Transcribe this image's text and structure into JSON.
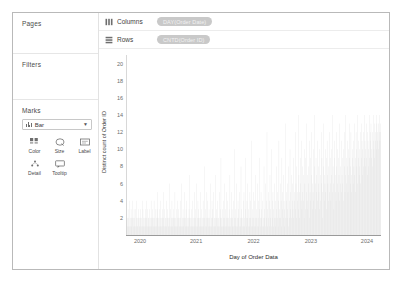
{
  "left_panel": {
    "pages_label": "Pages",
    "filters_label": "Filters",
    "marks_label": "Marks",
    "mark_type": "Bar",
    "mark_type_icon": "bar-chart-icon",
    "mark_buttons": [
      {
        "label": "Color",
        "icon": "color-icon"
      },
      {
        "label": "Size",
        "icon": "size-icon"
      },
      {
        "label": "Label",
        "icon": "label-icon"
      },
      {
        "label": "Detail",
        "icon": "detail-icon"
      },
      {
        "label": "Tooltip",
        "icon": "tooltip-icon"
      }
    ]
  },
  "shelves": {
    "columns_label": "Columns",
    "columns_icon": "columns-grid-icon",
    "columns_pill": "DAY(Order Date)",
    "rows_label": "Rows",
    "rows_icon": "rows-grid-icon",
    "rows_pill": "CNTD(Order ID)"
  },
  "colors": {
    "pill_fill": "#c9c9c9",
    "bar_fill": "#d6d6d6",
    "axis": "#9a9a9a",
    "panel_border": "#b9b9b9"
  },
  "chart_data": {
    "type": "bar",
    "title": "",
    "xlabel": "Day of Order Data",
    "ylabel": "Distinct count of Order ID",
    "xtick_labels": [
      "2020",
      "2021",
      "2022",
      "2023",
      "2024"
    ],
    "xtick_positions": [
      0.055,
      0.275,
      0.5,
      0.725,
      0.945
    ],
    "ytick_labels": [
      "20",
      "18",
      "16",
      "14",
      "12",
      "10",
      "8",
      "6",
      "4",
      "2"
    ],
    "ylim": [
      0,
      21
    ],
    "grid": false,
    "legend": null,
    "x_range": [
      "2020",
      "2024"
    ],
    "series": [
      {
        "name": "CNTD(Order ID)",
        "note": "daily distinct order counts; density and height increase over time",
        "values": [
          2,
          1,
          3,
          1,
          2,
          4,
          1,
          2,
          1,
          3,
          2,
          1,
          4,
          2,
          1,
          2,
          3,
          1,
          2,
          1,
          3,
          2,
          4,
          1,
          2,
          1,
          2,
          3,
          1,
          2,
          1,
          3,
          2,
          1,
          2,
          4,
          1,
          3,
          2,
          1,
          2,
          1,
          3,
          2,
          1,
          4,
          2,
          1,
          3,
          2,
          1,
          2,
          3,
          1,
          2,
          1,
          4,
          2,
          1,
          3,
          2,
          1,
          2,
          4,
          1,
          2,
          3,
          1,
          2,
          1,
          3,
          5,
          2,
          1,
          2,
          3,
          1,
          2,
          4,
          1,
          2,
          1,
          3,
          2,
          1,
          2,
          5,
          1,
          3,
          2,
          1,
          2,
          4,
          1,
          2,
          3,
          1,
          2,
          1,
          6,
          2,
          1,
          3,
          2,
          1,
          4,
          2,
          1,
          2,
          3,
          1,
          2,
          5,
          1,
          2,
          1,
          3,
          2,
          4,
          1,
          2,
          3,
          1,
          2,
          1,
          4,
          2,
          1,
          6,
          2,
          1,
          3,
          2,
          1,
          2,
          5,
          1,
          2,
          3,
          1,
          4,
          2,
          1,
          2,
          1,
          3,
          2,
          7,
          1,
          2,
          3,
          1,
          2,
          4,
          1,
          2,
          1,
          5,
          2,
          1,
          3,
          2,
          6,
          1,
          2,
          1,
          4,
          2,
          3,
          1,
          2,
          1,
          5,
          2,
          1,
          3,
          2,
          1,
          4,
          2,
          1,
          8,
          2,
          1,
          3,
          2,
          1,
          5,
          2,
          4,
          1,
          2,
          3,
          1,
          2,
          6,
          1,
          2,
          1,
          4,
          3,
          2,
          1,
          5,
          2,
          1,
          2,
          7,
          1,
          3,
          2,
          1,
          4,
          2,
          1,
          2,
          5,
          1,
          3,
          2,
          9,
          1,
          2,
          3,
          1,
          4,
          2,
          1,
          6,
          2,
          1,
          3,
          2,
          5,
          1,
          2,
          4,
          1,
          2,
          3,
          1,
          7,
          2,
          1,
          5,
          2,
          3,
          1,
          2,
          4,
          1,
          10,
          2,
          1,
          3,
          2,
          1,
          6,
          2,
          1,
          4,
          3,
          2,
          5,
          1,
          2,
          1,
          8,
          2,
          3,
          1,
          2,
          4,
          1,
          5,
          2,
          1,
          3,
          9,
          2,
          1,
          4,
          2,
          6,
          1,
          3,
          2,
          1,
          5,
          2,
          4,
          1,
          11,
          2,
          3,
          1,
          2,
          5,
          1,
          4,
          2,
          7,
          1,
          3,
          2,
          1,
          6,
          2,
          4,
          1,
          3,
          9,
          2,
          1,
          5,
          2,
          3,
          1,
          4,
          2,
          1,
          8,
          3,
          2,
          6,
          1,
          4,
          2,
          12,
          3,
          1,
          5,
          2,
          4,
          1,
          7,
          3,
          2,
          1,
          10,
          4,
          2,
          5,
          1,
          3,
          2,
          6,
          4,
          1,
          2,
          8,
          3,
          5,
          2,
          1,
          4,
          11,
          2,
          3,
          6,
          2,
          4,
          1,
          9,
          3,
          5,
          2,
          7,
          4,
          1,
          3,
          2,
          13,
          5,
          4,
          2,
          6,
          3,
          1,
          8,
          4,
          2,
          10,
          5,
          3,
          2,
          7,
          4,
          6,
          3,
          2,
          9,
          5,
          4,
          12,
          3,
          6,
          2,
          8,
          5,
          4,
          3,
          14,
          7,
          5,
          2,
          9,
          6,
          4,
          11,
          3,
          8,
          5,
          7,
          4,
          2,
          10,
          6,
          3,
          9,
          5,
          13,
          4,
          7,
          3,
          8,
          6,
          2,
          11,
          5,
          9,
          4,
          12,
          7,
          3,
          6,
          5,
          10,
          4,
          8,
          14,
          6,
          3,
          9,
          5,
          7,
          4,
          11,
          6,
          8,
          5,
          3,
          10,
          7,
          4,
          12,
          6,
          9,
          5,
          2,
          8,
          13,
          7,
          4,
          6,
          10,
          5,
          9,
          3,
          11,
          7,
          6,
          4,
          8,
          5,
          12,
          9,
          6,
          4,
          10,
          7,
          5,
          14,
          8,
          6,
          3,
          11,
          9,
          5,
          7,
          4,
          12,
          8,
          6,
          10,
          5,
          9,
          7,
          4,
          13,
          6,
          8,
          5,
          11,
          7,
          9,
          6,
          4,
          10,
          12,
          8,
          5,
          7,
          14,
          9,
          6,
          11,
          8,
          5,
          10,
          7,
          13,
          9,
          6,
          8,
          12,
          7,
          5,
          10,
          9,
          6,
          11,
          8,
          7,
          13,
          9,
          5,
          12,
          10,
          8,
          6,
          14,
          11,
          9,
          7,
          10,
          8,
          12,
          6,
          9,
          13,
          11,
          7,
          10,
          8,
          12,
          9,
          14,
          11,
          8,
          10,
          13,
          9,
          7,
          12,
          11,
          10,
          8,
          14,
          9,
          12,
          11,
          13,
          10,
          9,
          8,
          12,
          14,
          11,
          10,
          13,
          9,
          12,
          11,
          10,
          14,
          13,
          12,
          11,
          10,
          13,
          12,
          14,
          11,
          13,
          12
        ]
      }
    ]
  }
}
